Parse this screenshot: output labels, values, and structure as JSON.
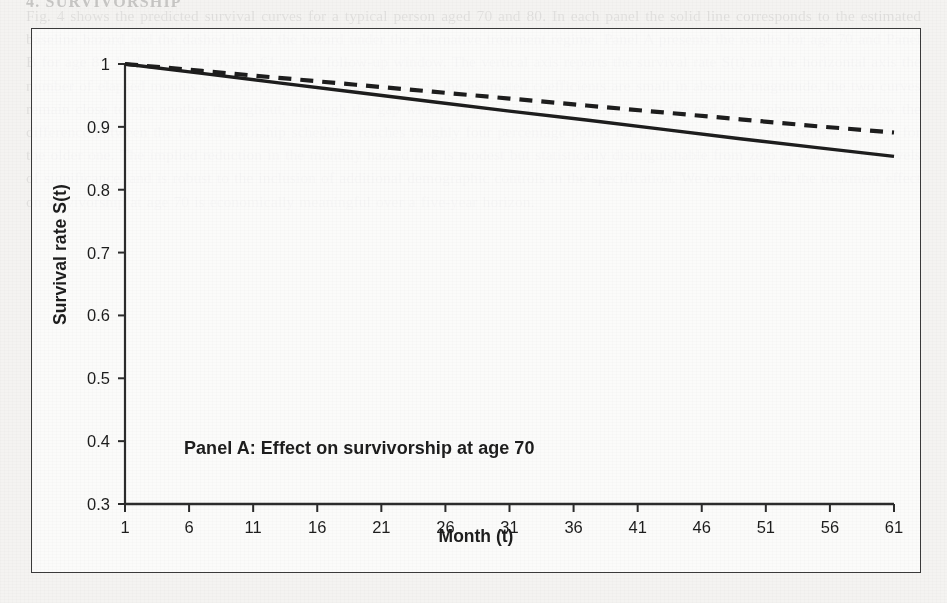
{
  "page": {
    "bleed_heading": "4.    SURVIVORSHIP",
    "bleed_text": "Fig. 4 shows the predicted survival curves for a typical person aged 70 and 80. In each panel the solid line corresponds to the estimated baseline hazard and the dashed line to the hazard under the alternative treatment regime. Panel A presents the results for age 70 and Panel B for age 80, both evaluated over a 61-month follow-up window. The vertical axis reports the survival rate S(t) and the horizontal axis the number of elapsed months since entry into the sample. Because the estimated coefficients are small in absolute magnitude, the two curves remain close to one another throughout, although the gap widens monotonically with duration. At the end of the observation window the difference between the two survivorship schedules reaches roughly four percentage points for the younger cohort and somewhat more for the older one. The implied reduction in the monthly hazard rate is modest but statistically distinguishable from zero at conventional levels of significance, and is robust to the inclusion of additional demographic controls in the specification. We conclude that the treatment effect on survivorship at age 70 is economically meaningful over a five-year horizon."
  },
  "chart_data": {
    "type": "line",
    "title": "Panel A: Effect on survivorship at age 70",
    "xlabel": "Month (t)",
    "ylabel": "Survival rate S(t)",
    "xlim": [
      1,
      61
    ],
    "ylim": [
      0.3,
      1
    ],
    "xticks": [
      1,
      6,
      11,
      16,
      21,
      26,
      31,
      36,
      41,
      46,
      51,
      56,
      61
    ],
    "yticks": [
      1,
      0.9,
      0.8,
      0.7,
      0.6,
      0.5,
      0.4,
      0.3
    ],
    "ytick_labels": [
      "1",
      "0.9",
      "0.8",
      "0.7",
      "0.6",
      "0.5",
      "0.4",
      "0.3"
    ],
    "grid": false,
    "legend": "none",
    "line_color": "#1d1d1d",
    "series": [
      {
        "name": "baseline",
        "style": "solid",
        "x": [
          1,
          7,
          13,
          19,
          25,
          31,
          37,
          43,
          49,
          55,
          61
        ],
        "values": [
          1.0,
          0.985,
          0.97,
          0.955,
          0.94,
          0.925,
          0.911,
          0.896,
          0.881,
          0.867,
          0.853
        ]
      },
      {
        "name": "alternative",
        "style": "dashed",
        "x": [
          1,
          7,
          13,
          19,
          25,
          31,
          37,
          43,
          49,
          55,
          61
        ],
        "values": [
          1.0,
          0.989,
          0.978,
          0.967,
          0.956,
          0.945,
          0.934,
          0.923,
          0.912,
          0.901,
          0.891
        ]
      }
    ]
  }
}
